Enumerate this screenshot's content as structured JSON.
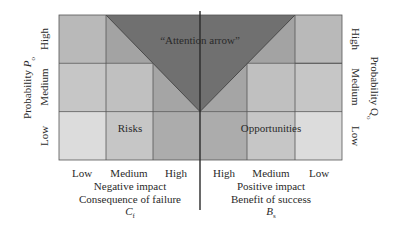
{
  "diagram": {
    "colors": {
      "triangle": "#707070",
      "cell_lightest": "#dedede",
      "cell_light": "#c8c8c8",
      "cell_mid": "#bababa",
      "cell_dark": "#a8a8a8",
      "grid_line": "#555555"
    },
    "grid": {
      "columns_left": [
        "Low",
        "Medium",
        "High"
      ],
      "columns_right": [
        "High",
        "Medium",
        "Low"
      ],
      "rows": [
        "High",
        "Medium",
        "Low"
      ],
      "cells_left": [
        [
          "#b9b9b9",
          "#a3a3a3",
          "#a0a0a0"
        ],
        [
          "#c6c6c6",
          "#c0c0c0",
          "#a5a5a5"
        ],
        [
          "#dcdcdc",
          "#c6c6c6",
          "#acacac"
        ]
      ],
      "cells_right": [
        [
          "#a0a0a0",
          "#a3a3a3",
          "#b9b9b9"
        ],
        [
          "#a5a5a5",
          "#c0c0c0",
          "#c6c6c6"
        ],
        [
          "#acacac",
          "#c6c6c6",
          "#dcdcdc"
        ]
      ]
    },
    "attention_label": "“Attention arrow”",
    "risks_label": "Risks",
    "opportunities_label": "Opportunities",
    "left_axis": {
      "title": "Probability ",
      "symbol": "P",
      "subscript": "o",
      "ticks": [
        "High",
        "Medium",
        "Low"
      ]
    },
    "right_axis": {
      "title": "Probability ",
      "symbol": "Q",
      "subscript": "o",
      "ticks": [
        "High",
        "Medium",
        "Low"
      ]
    },
    "bottom_left": {
      "ticks": [
        "Low",
        "Medium",
        "High"
      ],
      "line1": "Negative impact",
      "line2": "Consequence of failure",
      "symbol": "C",
      "subscript": "f"
    },
    "bottom_right": {
      "ticks": [
        "High",
        "Medium",
        "Low"
      ],
      "line1": "Positive impact",
      "line2": "Benefit of success",
      "symbol": "B",
      "subscript": "s"
    }
  }
}
